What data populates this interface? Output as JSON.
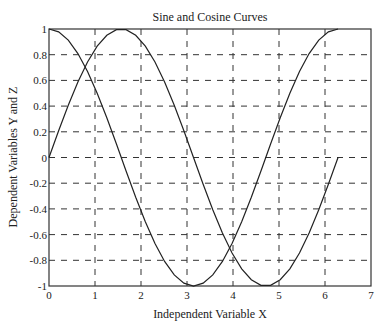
{
  "chart_data": {
    "type": "line",
    "title": "Sine and Cosine Curves",
    "xlabel": "Independent Variable X",
    "ylabel": "Dependent Variables Y and Z",
    "xlim": [
      0,
      7
    ],
    "ylim": [
      -1,
      1
    ],
    "grid": true,
    "legend": "none",
    "xticks": [
      "0",
      "1",
      "2",
      "3",
      "4",
      "5",
      "6",
      "7"
    ],
    "yticks": [
      "-1",
      "-0.8",
      "-0.6",
      "-0.4",
      "-0.2",
      "0",
      "0.2",
      "0.4",
      "0.6",
      "0.8",
      "1"
    ],
    "series": [
      {
        "name": "sin(x)",
        "function": "sin",
        "x_range": [
          0,
          6.2832
        ],
        "points": 31,
        "color": "#222222"
      },
      {
        "name": "cos(x)",
        "function": "cos",
        "x_range": [
          0,
          6.2832
        ],
        "points": 31,
        "color": "#222222"
      }
    ]
  }
}
